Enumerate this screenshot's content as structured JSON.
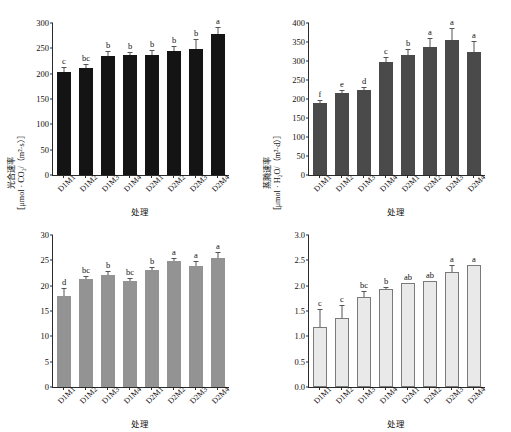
{
  "figure": {
    "top_cut_text": "",
    "x_axis_title": "处理",
    "categories": [
      "D1M1",
      "D1M2",
      "D1M3",
      "D1M4",
      "D2M1",
      "D2M2",
      "D2M3",
      "D2M4"
    ]
  },
  "chart_data": [
    {
      "type": "bar",
      "panel": "top-left",
      "title": "",
      "ylabel_line1": "胞间CO₂浓度",
      "ylabel_line2": "（μmol · CO₂/mol）",
      "xlabel": "处理",
      "categories": [
        "D1M1",
        "D1M2",
        "D1M3",
        "D1M4",
        "D2M1",
        "D2M2",
        "D2M3",
        "D2M4"
      ],
      "values": [
        204,
        211,
        234,
        237,
        236,
        244,
        249,
        279
      ],
      "errors": [
        7,
        6,
        8,
        4,
        9,
        8,
        17,
        11
      ],
      "annotations": [
        "c",
        "bc",
        "b",
        "b",
        "b",
        "b",
        "b",
        "a"
      ],
      "ylim": [
        0,
        300
      ],
      "yticks": [
        0,
        50,
        100,
        150,
        200,
        250,
        300
      ],
      "bar_color": "#141414",
      "grid": false,
      "legend": "none"
    },
    {
      "type": "bar",
      "panel": "top-right",
      "title": "",
      "ylabel_line1": "气孔导度",
      "ylabel_line2": "［μmol · H₂O/（m²·d）］",
      "xlabel": "处理",
      "categories": [
        "D1M1",
        "D1M2",
        "D1M3",
        "D1M4",
        "D2M1",
        "D2M2",
        "D2M3",
        "D2M4"
      ],
      "values": [
        190,
        215,
        225,
        298,
        317,
        338,
        355,
        323
      ],
      "errors": [
        5,
        7,
        5,
        11,
        13,
        19,
        30,
        28
      ],
      "annotations": [
        "f",
        "e",
        "d",
        "c",
        "b",
        "a",
        "a",
        "a"
      ],
      "ylim": [
        0,
        400
      ],
      "yticks": [
        0,
        50,
        100,
        150,
        200,
        250,
        300,
        350,
        400
      ],
      "bar_color": "#4a4a4a",
      "grid": false,
      "legend": "none"
    },
    {
      "type": "bar",
      "panel": "bottom-left",
      "title": "",
      "ylabel_line1": "光合速率",
      "ylabel_line2": "［μmol · CO₂/（m²·s）］",
      "xlabel": "处理",
      "categories": [
        "D1M1",
        "D1M2",
        "D1M3",
        "D1M4",
        "D2M1",
        "D2M2",
        "D2M3",
        "D2M4"
      ],
      "values": [
        17.9,
        21.3,
        22.2,
        20.9,
        23.0,
        24.8,
        23.8,
        25.4
      ],
      "errors": [
        1.5,
        0.4,
        0.5,
        0.5,
        0.5,
        0.5,
        0.8,
        1.1
      ],
      "annotations": [
        "d",
        "bc",
        "b",
        "bc",
        "b",
        "a",
        "a",
        "a"
      ],
      "ylim": [
        0,
        30
      ],
      "yticks": [
        0,
        5,
        10,
        15,
        20,
        25,
        30
      ],
      "bar_color": "#939393",
      "grid": false,
      "legend": "none"
    },
    {
      "type": "bar",
      "panel": "bottom-right",
      "title": "",
      "ylabel_line1": "蒸腾速率",
      "ylabel_line2": "［μmol · H₂O/（m²·d）］",
      "xlabel": "处理",
      "categories": [
        "D1M1",
        "D1M2",
        "D1M3",
        "D1M4",
        "D2M1",
        "D2M2",
        "D2M3",
        "D2M4"
      ],
      "values": [
        1.14,
        1.33,
        1.74,
        1.9,
        2.02,
        2.06,
        2.24,
        2.37
      ],
      "errors": [
        0.38,
        0.26,
        0.13,
        0.06,
        0.02,
        0.02,
        0.14,
        0.02
      ],
      "annotations": [
        "c",
        "c",
        "bc",
        "b",
        "ab",
        "ab",
        "a",
        "a"
      ],
      "ylim": [
        0,
        3.0
      ],
      "yticks": [
        "0.0",
        "0.5",
        "1.0",
        "1.5",
        "2.0",
        "2.5",
        "3.0"
      ],
      "ytick_values": [
        0,
        0.5,
        1.0,
        1.5,
        2.0,
        2.5,
        3.0
      ],
      "bar_color": "#e9e9e9",
      "bar_edge_color": "#7a7a7a",
      "grid": false,
      "legend": "none"
    }
  ]
}
